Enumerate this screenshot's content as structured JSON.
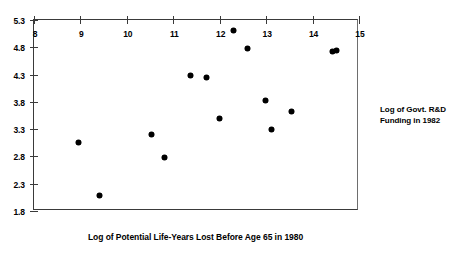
{
  "chart_data": {
    "type": "scatter",
    "title": "",
    "subtitle": "",
    "xlabel": "Log of Potential Life-Years Lost Before Age 65 in 1980",
    "ylabel": "Log of Govt. R&D Funding in 1982",
    "ylabel_lines": [
      "Log of Govt. R&D",
      "Funding in 1982"
    ],
    "xlim": [
      8,
      15
    ],
    "ylim": [
      1.8,
      5.3
    ],
    "xticks": [
      8,
      9,
      10,
      11,
      12,
      13,
      14,
      15
    ],
    "yticks": [
      1.8,
      2.3,
      2.8,
      3.3,
      3.8,
      4.3,
      4.8,
      5.3
    ],
    "xtick_labels": [
      "8",
      "9",
      "10",
      "11",
      "12",
      "13",
      "14",
      "15"
    ],
    "ytick_labels": [
      "1.8",
      "2.3",
      "2.8",
      "3.3",
      "3.8",
      "4.3",
      "4.8",
      "5.3"
    ],
    "grid": false,
    "legend": null,
    "legend_position": "none",
    "marker": "filled-diamond",
    "marker_color": "#000000",
    "series": [
      {
        "name": "Disease categories",
        "points": [
          {
            "x": 8.95,
            "y": 3.05
          },
          {
            "x": 9.42,
            "y": 2.09
          },
          {
            "x": 10.52,
            "y": 3.21
          },
          {
            "x": 10.8,
            "y": 2.78
          },
          {
            "x": 11.36,
            "y": 4.29
          },
          {
            "x": 11.72,
            "y": 4.24
          },
          {
            "x": 12.0,
            "y": 3.49
          },
          {
            "x": 12.3,
            "y": 5.1
          },
          {
            "x": 12.6,
            "y": 4.77
          },
          {
            "x": 12.98,
            "y": 3.83
          },
          {
            "x": 13.12,
            "y": 3.29
          },
          {
            "x": 13.54,
            "y": 3.63
          },
          {
            "x": 14.42,
            "y": 4.72
          },
          {
            "x": 14.52,
            "y": 4.74
          }
        ]
      }
    ]
  },
  "axis_titles": {
    "x": "Log of Potential Life-Years Lost Before Age 65 in 1980",
    "y_line1": "Log of Govt. R&D",
    "y_line2": "Funding in 1982"
  },
  "colors": {
    "marker": "#000000",
    "axis": "#3a3a3a",
    "background": "#ffffff",
    "text": "#000000"
  }
}
